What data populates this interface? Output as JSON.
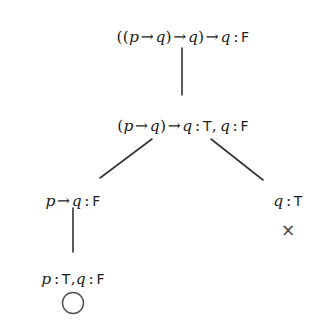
{
  "diagram": {
    "type": "semantic-tableau",
    "background_color": "#ffffff",
    "text_color": "#1d1d1d",
    "edge_color": "#333333",
    "nodes": [
      {
        "id": "root",
        "level": 1,
        "text": "((p → q) → q) → q : F",
        "x": 183,
        "y": 30,
        "parts": [
          {
            "t": "((",
            "style": "paren"
          },
          {
            "t": "p",
            "style": "var"
          },
          {
            "t": "→",
            "style": "op"
          },
          {
            "t": "q",
            "style": "var"
          },
          {
            "t": ")",
            "style": "paren"
          },
          {
            "t": "→",
            "style": "op"
          },
          {
            "t": "q",
            "style": "var"
          },
          {
            "t": ")",
            "style": "paren"
          },
          {
            "t": "→",
            "style": "op"
          },
          {
            "t": "q",
            "style": "var"
          },
          {
            "t": ":",
            "style": "colon"
          },
          {
            "t": "F",
            "style": "roman"
          }
        ]
      },
      {
        "id": "level2",
        "level": 2,
        "text": "(p → q) → q : T, q : F",
        "x": 183,
        "y": 119,
        "parts": [
          {
            "t": "(",
            "style": "paren"
          },
          {
            "t": "p",
            "style": "var"
          },
          {
            "t": "→",
            "style": "op"
          },
          {
            "t": "q",
            "style": "var"
          },
          {
            "t": ")",
            "style": "paren"
          },
          {
            "t": "→",
            "style": "op"
          },
          {
            "t": "q",
            "style": "var"
          },
          {
            "t": ":",
            "style": "colon"
          },
          {
            "t": "T",
            "style": "roman"
          },
          {
            "t": ",",
            "style": "comma"
          },
          {
            "t": " ",
            "style": "sp"
          },
          {
            "t": "q",
            "style": "var"
          },
          {
            "t": ":",
            "style": "colon"
          },
          {
            "t": "F",
            "style": "roman"
          }
        ]
      },
      {
        "id": "left-branch",
        "level": 3,
        "text": "p → q : F",
        "x": 73,
        "y": 194,
        "parts": [
          {
            "t": "p",
            "style": "var"
          },
          {
            "t": "→",
            "style": "op"
          },
          {
            "t": "q",
            "style": "var"
          },
          {
            "t": ":",
            "style": "colon"
          },
          {
            "t": "F",
            "style": "roman"
          }
        ]
      },
      {
        "id": "right-branch",
        "level": 3,
        "text": "q : T",
        "x": 288,
        "y": 194,
        "parts": [
          {
            "t": "q",
            "style": "var"
          },
          {
            "t": ":",
            "style": "colon"
          },
          {
            "t": "T",
            "style": "roman"
          }
        ]
      },
      {
        "id": "leaf",
        "level": 4,
        "text": "p : T,q : F",
        "x": 73,
        "y": 272,
        "parts": [
          {
            "t": "p",
            "style": "var"
          },
          {
            "t": ":",
            "style": "colon"
          },
          {
            "t": "T",
            "style": "roman"
          },
          {
            "t": ",",
            "style": "comma"
          },
          {
            "t": "q",
            "style": "var"
          },
          {
            "t": ":",
            "style": "colon"
          },
          {
            "t": "F",
            "style": "roman"
          }
        ]
      }
    ],
    "edges": [
      {
        "id": "root-to-level2",
        "kind": "vertical",
        "x1": 182,
        "y1": 48,
        "x2": 182,
        "y2": 95
      },
      {
        "id": "level2-to-left",
        "kind": "diagonal",
        "x1": 152,
        "y1": 139,
        "x2": 100,
        "y2": 178
      },
      {
        "id": "level2-to-right",
        "kind": "diagonal",
        "x1": 211,
        "y1": 139,
        "x2": 263,
        "y2": 180
      },
      {
        "id": "left-to-leaf",
        "kind": "vertical",
        "x1": 73,
        "y1": 208,
        "x2": 73,
        "y2": 252
      }
    ],
    "markers": [
      {
        "id": "closed-branch",
        "name": "closed-branch-marker",
        "glyph": "×",
        "meaning": "closed",
        "x": 288,
        "y": 222
      },
      {
        "id": "open-branch",
        "name": "open-branch-marker",
        "glyph": "○",
        "meaning": "open",
        "x": 73,
        "y": 303,
        "radius": 10.5
      }
    ]
  }
}
